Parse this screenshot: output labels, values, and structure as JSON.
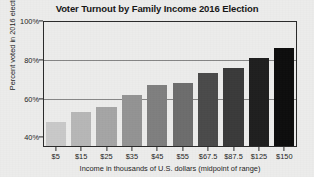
{
  "chart_data": {
    "type": "bar",
    "title": "Voter Turnout by Family Income 2016 Election",
    "xlabel": "Income in thousands of U.S. dollars (midpoint of range)",
    "ylabel": "Percent voted in 2016 election",
    "categories": [
      "$5",
      "$15",
      "$25",
      "$35",
      "$45",
      "$55",
      "$67.5",
      "$87.5",
      "$125",
      "$150"
    ],
    "values": [
      48,
      53,
      55.5,
      62,
      67,
      68,
      73,
      76,
      81,
      86
    ],
    "ylim": [
      35,
      100
    ],
    "ytick_labels": [
      "40%",
      "60%",
      "80%",
      "100%"
    ],
    "ytick_values": [
      40,
      60,
      80,
      100
    ],
    "gridlines_at": [
      60,
      80,
      100
    ],
    "grid": true,
    "legend": "none",
    "bar_colors": [
      "#c9c9c9",
      "#b7b7b7",
      "#a5a5a5",
      "#939393",
      "#7f7f7f",
      "#6d6d6d",
      "#4a4a4a",
      "#3a3a3a",
      "#1f1f1f",
      "#0d0d0d"
    ],
    "axis_color": "#2a2a2a",
    "gridline_color": "#868686",
    "background_color": "#ececeb"
  }
}
